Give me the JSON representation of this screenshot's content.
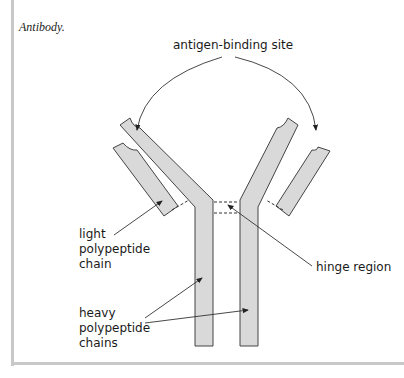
{
  "caption": "Antibody.",
  "labels": {
    "antigen_binding_site": "antigen-binding site",
    "light_chain": [
      "light",
      "polypeptide",
      "chain"
    ],
    "hinge_region": "hinge region",
    "heavy_chains": [
      "heavy",
      "polypeptide",
      "chains"
    ]
  },
  "colors": {
    "chain_fill": "#d9d9d9",
    "chain_stroke": "#444444",
    "frame": "#c8c8c8"
  }
}
